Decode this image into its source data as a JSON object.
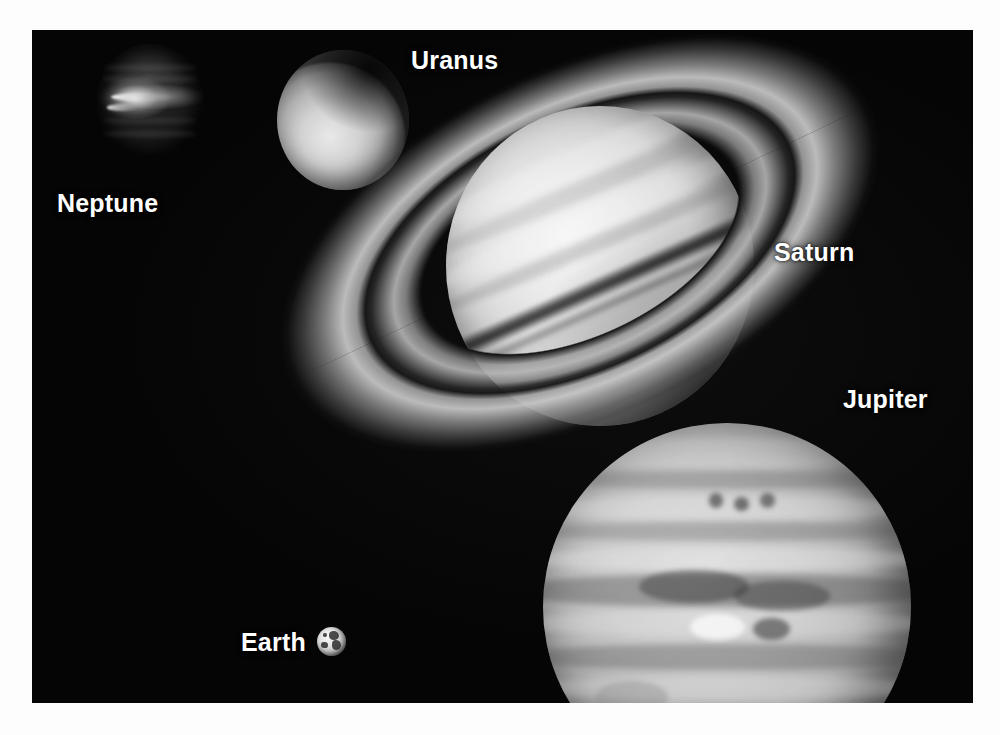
{
  "scene": {
    "title": "Outer planets size-comparison montage",
    "background_color": "#ffffff",
    "panel_color": "#050505"
  },
  "labels": {
    "neptune": "Neptune",
    "uranus": "Uranus",
    "saturn": "Saturn",
    "jupiter": "Jupiter",
    "earth": "Earth"
  },
  "label_style": {
    "color": "#ffffff",
    "weight": "bold",
    "size_px": 25
  },
  "planets": [
    {
      "name": "Neptune",
      "label": "Neptune",
      "appearance": "very dark disk with a bright narrow equatorial streak",
      "relative_size": "small",
      "center_px": [
        150,
        115
      ],
      "diameter_px": 110
    },
    {
      "name": "Uranus",
      "label": "Uranus",
      "appearance": "featureless pale disk, bright lower-left, dark limb upper-right",
      "relative_size": "small",
      "center_px": [
        343,
        120
      ],
      "diameter_px": 136
    },
    {
      "name": "Saturn",
      "label": "Saturn",
      "appearance": "bright banded globe with wide tilted ring system and ring shadow",
      "relative_size": "large",
      "center_px": [
        568,
        236
      ],
      "diameter_px": 314,
      "ring_tilt_deg": -25.5,
      "ring_span_px": 612
    },
    {
      "name": "Jupiter",
      "label": "Jupiter",
      "appearance": "largest globe, strong horizontal cloud belts and turbulent mid-latitude zone",
      "relative_size": "largest",
      "center_px": [
        727,
        607
      ],
      "diameter_px": 368
    },
    {
      "name": "Earth",
      "label": "Earth",
      "appearance": "tiny mottled sphere shown for scale next to its label",
      "relative_size": "tiny",
      "center_px": [
        331,
        641
      ],
      "diameter_px": 29
    }
  ],
  "icons": {
    "earth_marker": "earth-globe-icon"
  }
}
